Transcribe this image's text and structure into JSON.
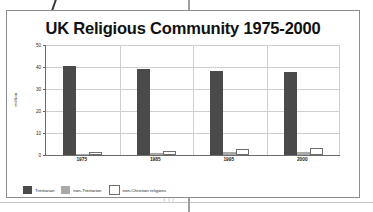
{
  "chart_data": {
    "type": "bar",
    "title": "UK Religious Community 1975-2000",
    "xlabel": "",
    "ylabel": "million",
    "categories": [
      "1975",
      "1985",
      "1995",
      "2000"
    ],
    "series": [
      {
        "name": "Trinitarian",
        "values": [
          40.5,
          39.3,
          38.2,
          37.9
        ],
        "color": "#4a4a4a"
      },
      {
        "name": "non-Trinitarian",
        "values": [
          0.6,
          0.8,
          1.2,
          1.3
        ],
        "color": "#a9a9a9"
      },
      {
        "name": "non-Christian religions",
        "values": [
          1.3,
          2.0,
          2.7,
          3.0
        ],
        "color": "#ffffff"
      }
    ],
    "ylim": [
      0,
      50
    ],
    "yticks": [
      "0",
      "10",
      "20",
      "30",
      "40",
      "50"
    ],
    "ytick_values": [
      0,
      10,
      20,
      30,
      40,
      50
    ],
    "grid": true,
    "legend_position": "bottom-left"
  },
  "artifacts": {
    "page_number": "10"
  }
}
